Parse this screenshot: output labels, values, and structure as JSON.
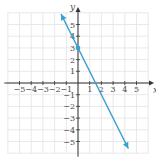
{
  "chart_data": {
    "type": "line",
    "title": "",
    "xlabel": "x",
    "ylabel": "y",
    "xlim": [
      -6,
      6
    ],
    "ylim": [
      -6,
      6
    ],
    "grid": true,
    "x_tick_labels": [
      "−5",
      "−4",
      "−3",
      "−2",
      "−1",
      "1",
      "2",
      "3",
      "4",
      "5"
    ],
    "y_tick_labels": [
      "5",
      "4",
      "3",
      "2",
      "1",
      "−1",
      "−2",
      "−3",
      "−4",
      "−5"
    ],
    "x_ticks": [
      -5,
      -4,
      -3,
      -2,
      -1,
      1,
      2,
      3,
      4,
      5
    ],
    "y_ticks": [
      5,
      4,
      3,
      2,
      1,
      -1,
      -2,
      -3,
      -4,
      -5
    ],
    "series": [
      {
        "name": "y = -2x + 3",
        "x": [
          -1.45,
          4.3
        ],
        "y": [
          5.9,
          -5.6
        ],
        "color": "#3a9fd0",
        "arrows_both_ends": true
      }
    ],
    "points": [
      {
        "x": 0,
        "y": 3,
        "label": "y-intercept"
      }
    ],
    "colors": {
      "line": "#3a9fd0",
      "grid": "#e2e2e2",
      "axis": "#333333"
    }
  }
}
